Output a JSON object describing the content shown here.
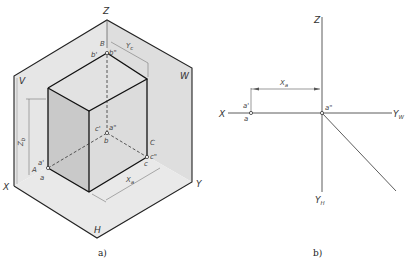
{
  "figure_a": {
    "caption": "a)",
    "axes": {
      "z": "Z",
      "x": "X",
      "y": "Y"
    },
    "planes": {
      "v": "V",
      "w": "W",
      "h": "H"
    },
    "points": {
      "B": "B",
      "b_prime": "b'",
      "b_dprime": "b\"",
      "c_prime": "c'",
      "a_dprime": "a\"",
      "b": "b",
      "C": "C",
      "c_dprime": "c\"",
      "c": "c",
      "a_prime": "a'",
      "A": "A",
      "a": "a"
    },
    "dimensions": {
      "yc": "Y",
      "yc_sub": "c",
      "zb": "Z",
      "zb_sub": "b",
      "xa": "X",
      "xa_sub": "a"
    },
    "colors": {
      "plane_fill": "#e4e4e4",
      "cube_side": "#c8c8c8",
      "cube_front": "#d9d9d9",
      "line": "#222222"
    }
  },
  "figure_b": {
    "caption": "b)",
    "axes": {
      "z": "Z",
      "x": "X",
      "yw": "Y",
      "yw_sub": "W",
      "yh": "Y",
      "yh_sub": "H"
    },
    "points": {
      "a_prime": "a'",
      "a": "a",
      "a_dprime": "a\""
    },
    "dimensions": {
      "xa": "X",
      "xa_sub": "a"
    }
  }
}
